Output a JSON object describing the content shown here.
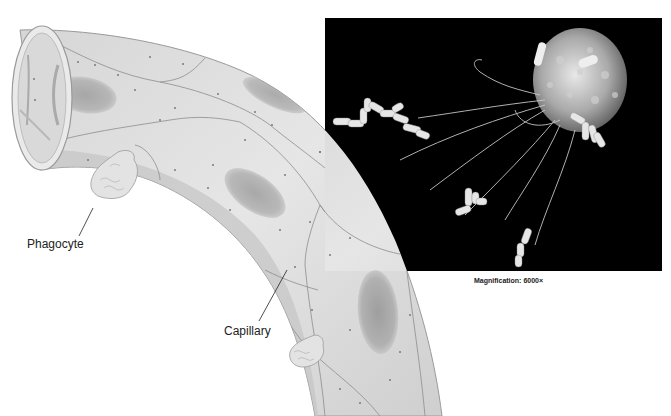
{
  "figure": {
    "type": "biology-illustration"
  },
  "labels": {
    "phagocyte": "Phagocyte",
    "capillary": "Capillary"
  },
  "micrograph": {
    "caption": "Magnification: 6000×",
    "background": "#000000"
  },
  "colors": {
    "tube_fill": "#dcdcdc",
    "tube_shadow": "#bdbdbd",
    "cell_border": "#8a8a8a",
    "nucleus": "#a8a8a8",
    "leader_line": "#222222",
    "text": "#222222"
  }
}
